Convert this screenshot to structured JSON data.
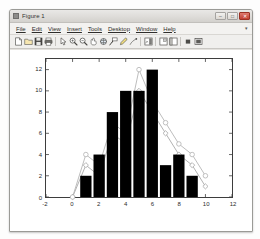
{
  "window": {
    "title": "Figure 1",
    "icon": "matlab-figure-icon",
    "controls": [
      {
        "name": "minimize-button",
        "glyph": "–"
      },
      {
        "name": "maximize-button",
        "glyph": "□"
      },
      {
        "name": "close-button",
        "glyph": "✕"
      }
    ]
  },
  "menubar": {
    "items": [
      {
        "label": "File",
        "accel": "F"
      },
      {
        "label": "Edit",
        "accel": "E"
      },
      {
        "label": "View",
        "accel": "V"
      },
      {
        "label": "Insert",
        "accel": "I"
      },
      {
        "label": "Tools",
        "accel": "T"
      },
      {
        "label": "Desktop",
        "accel": "D"
      },
      {
        "label": "Window",
        "accel": "W"
      },
      {
        "label": "Help",
        "accel": "H"
      }
    ],
    "dock_arrow": "▾"
  },
  "toolbar": {
    "items": [
      {
        "name": "new-figure-icon",
        "tip": "New Figure"
      },
      {
        "name": "open-file-icon",
        "tip": "Open File"
      },
      {
        "name": "save-figure-icon",
        "tip": "Save Figure"
      },
      {
        "name": "print-figure-icon",
        "tip": "Print Figure"
      },
      {
        "name": "edit-plot-pointer-icon",
        "tip": "Edit Plot"
      },
      {
        "name": "zoom-in-icon",
        "tip": "Zoom In"
      },
      {
        "name": "zoom-out-icon",
        "tip": "Zoom Out"
      },
      {
        "name": "pan-icon",
        "tip": "Pan"
      },
      {
        "name": "rotate-3d-icon",
        "tip": "Rotate 3D"
      },
      {
        "name": "data-cursor-icon",
        "tip": "Data Cursor"
      },
      {
        "name": "brush-select-icon",
        "tip": "Brush/Select Data"
      },
      {
        "name": "link-plot-icon",
        "tip": "Link Plot"
      },
      {
        "name": "insert-colorbar-icon",
        "tip": "Insert Colorbar"
      },
      {
        "name": "insert-legend-icon",
        "tip": "Insert Legend"
      },
      {
        "name": "hide-plot-tools-icon",
        "tip": "Hide Plot Tools"
      },
      {
        "name": "show-plot-tools-icon",
        "tip": "Show Plot Tools and Dock Figure"
      }
    ]
  },
  "chart_data": {
    "type": "bar",
    "title": "",
    "xlabel": "",
    "ylabel": "",
    "xlim": [
      -2,
      12
    ],
    "ylim": [
      0,
      13
    ],
    "xticks": [
      -2,
      0,
      2,
      4,
      6,
      8,
      10,
      12
    ],
    "yticks": [
      0,
      2,
      4,
      6,
      8,
      10,
      12
    ],
    "xtick_labels": [
      "-2",
      "0",
      "2",
      "4",
      "6",
      "8",
      "10",
      "12"
    ],
    "ytick_labels": [
      "0",
      "2",
      "4",
      "6",
      "8",
      "10",
      "12"
    ],
    "grid": false,
    "legend": "none",
    "bar_color": "#000000",
    "bar_width": 0.85,
    "categories": [
      1,
      2,
      3,
      4,
      5,
      6,
      7,
      8,
      9
    ],
    "values": [
      2,
      4,
      8,
      10,
      10,
      12,
      3,
      4,
      2
    ],
    "series": [
      {
        "name": "line-series-1",
        "marker": "diamond",
        "color": "#a8a8a8",
        "x": [
          0,
          1,
          2,
          3,
          4,
          5,
          6,
          7,
          8,
          9,
          10
        ],
        "y": [
          0,
          3,
          2,
          6,
          5,
          10,
          8,
          6,
          4,
          3,
          1
        ]
      },
      {
        "name": "line-series-2",
        "marker": "circle",
        "color": "#b5b5b5",
        "x": [
          0,
          1,
          2,
          3,
          4,
          5,
          6,
          7,
          8,
          9,
          10
        ],
        "y": [
          0,
          4,
          3,
          7,
          6,
          12,
          9,
          7,
          5,
          4,
          2
        ]
      }
    ]
  }
}
